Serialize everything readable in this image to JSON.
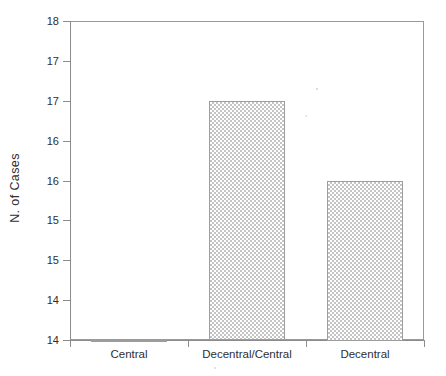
{
  "chart_data": {
    "type": "bar",
    "title": "",
    "subtitle": "",
    "xlabel": "",
    "ylabel": "N. of Cases",
    "categories": [
      "Central",
      "Decentral/Central",
      "Decentral"
    ],
    "values": [
      14.0,
      17.0,
      16.0
    ],
    "series": [
      {
        "name": "N. of Cases",
        "values": [
          14.0,
          17.0,
          16.0
        ]
      }
    ],
    "ylim": [
      14,
      18
    ],
    "ytick_values": [
      18,
      17.5,
      17,
      16.5,
      16,
      15.5,
      15,
      14.5,
      14
    ],
    "ytick_labels": [
      "18",
      "17",
      "17",
      "16",
      "16",
      "15",
      "15",
      "14",
      "14"
    ],
    "grid": false,
    "legend": false,
    "legend_position": "none",
    "bar_fill": "light-gray-checkerboard-dither",
    "bar_edge_color": "#9d9d9d",
    "frame_color": "#9a9a9a",
    "background_color": "#ffffff"
  },
  "axes": {
    "y_title": "N. of Cases",
    "y_ticks": [
      {
        "label": "18",
        "value": 18
      },
      {
        "label": "17",
        "value": 17.5
      },
      {
        "label": "17",
        "value": 17
      },
      {
        "label": "16",
        "value": 16.5
      },
      {
        "label": "16",
        "value": 16
      },
      {
        "label": "15",
        "value": 15.5
      },
      {
        "label": "15",
        "value": 15
      },
      {
        "label": "14",
        "value": 14.5
      },
      {
        "label": "14",
        "value": 14
      }
    ],
    "x_categories": [
      {
        "label": "Central",
        "value": 14.0
      },
      {
        "label": "Decentral/Central",
        "value": 17.0
      },
      {
        "label": "Decentral",
        "value": 16.0
      }
    ]
  }
}
